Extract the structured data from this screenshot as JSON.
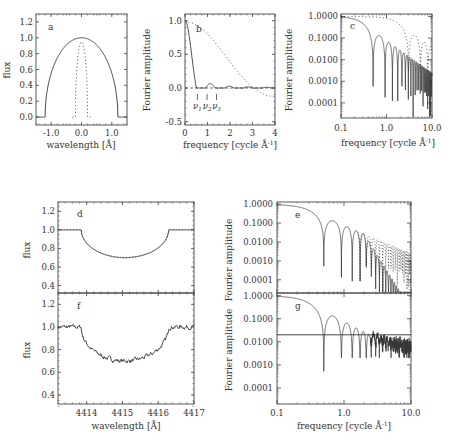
{
  "chart_data": [
    {
      "panel": "a",
      "type": "line",
      "xlabel": "wavelength [Å]",
      "ylabel": "flux",
      "xlim": [
        -1.5,
        1.5
      ],
      "ylim": [
        -0.1,
        1.3
      ],
      "xticks": [
        "-1.0",
        "0.0",
        "1.0"
      ],
      "yticks": [
        "0.0",
        "0.2",
        "0.4",
        "0.6",
        "0.8",
        "1.0",
        "1.2"
      ],
      "series": [
        {
          "name": "broad profile (solid)",
          "style": "solid",
          "description": "semi-ellipse from -1.2 to 1.2 Å, peak 1.0 at 0.0"
        },
        {
          "name": "narrow profile (dotted)",
          "style": "dotted",
          "description": "narrow peak ~0.95 at 0.0, width ~0.4 Å"
        }
      ]
    },
    {
      "panel": "b",
      "type": "line",
      "xlabel": "frequency [cycle Å⁻¹]",
      "ylabel": "Fourier amplitude",
      "xlim": [
        0,
        4
      ],
      "ylim": [
        -0.55,
        1.1
      ],
      "xticks": [
        "0",
        "1",
        "2",
        "3",
        "4"
      ],
      "yticks": [
        "-0.5",
        "0.0",
        "0.5",
        "1.0"
      ],
      "annotations": [
        "ν1",
        "ν2",
        "ν3"
      ],
      "annotation_x": [
        0.55,
        0.98,
        1.4
      ],
      "series": [
        {
          "name": "transform of broad profile (solid)",
          "style": "solid",
          "x": [
            0,
            0.2,
            0.4,
            0.55,
            0.75,
            0.98,
            1.15,
            1.4,
            1.6,
            2.0,
            4.0
          ],
          "y": [
            1.0,
            0.7,
            0.25,
            0.0,
            0.12,
            0.0,
            0.06,
            0.0,
            0.03,
            0.0,
            0.0
          ]
        },
        {
          "name": "transform of narrow profile (dotted)",
          "style": "dotted",
          "x": [
            0,
            1,
            2,
            3,
            4
          ],
          "y": [
            1.0,
            0.93,
            0.72,
            0.47,
            0.22
          ]
        }
      ]
    },
    {
      "panel": "c",
      "type": "line",
      "xscale": "log",
      "yscale": "log",
      "xlabel": "frequency [cycle Å⁻¹]",
      "ylabel": "Fourier amplitude",
      "xlim": [
        0.1,
        10.0
      ],
      "ylim": [
        2e-05,
        1.3
      ],
      "xticks": [
        "0.1",
        "1.0",
        "10.0"
      ],
      "yticks": [
        "0.0001",
        "0.0010",
        "0.0100",
        "0.1000",
        "1.0000"
      ],
      "series": [
        {
          "name": "solid",
          "style": "solid",
          "description": "sinc-like lobes, first zero ~0.55, lobe peaks ~0.1 at 0.75, decaying to ~0.003 at 10"
        },
        {
          "name": "dotted",
          "style": "dotted",
          "description": "smooth decline from 1.0 to ~0.003 near 10"
        }
      ]
    },
    {
      "panel": "d",
      "type": "line",
      "xlabel": "",
      "ylabel": "flux",
      "xlim": [
        4413.2,
        4417.0
      ],
      "ylim": [
        0.3,
        1.3
      ],
      "yticks": [
        "0.4",
        "0.6",
        "0.8",
        "1.0",
        "1.2"
      ],
      "series": [
        {
          "name": "model profile",
          "style": "solid",
          "description": "continuum 1.0, dip from 4413.85 to 4416.3, min 0.70 at 4415.05"
        }
      ]
    },
    {
      "panel": "f",
      "type": "line",
      "xlabel": "wavelength [Å]",
      "ylabel": "flux",
      "xlim": [
        4413.2,
        4417.0
      ],
      "ylim": [
        0.3,
        1.3
      ],
      "xticks": [
        "4414",
        "4415",
        "4416",
        "4417"
      ],
      "yticks": [
        "0.4",
        "0.6",
        "0.8",
        "1.0",
        "1.2"
      ],
      "series": [
        {
          "name": "observed noisy profile",
          "style": "solid",
          "description": "noisy continuum ~1.0, dip min ~0.69 at 4415.1"
        }
      ]
    },
    {
      "panel": "e",
      "type": "line",
      "xscale": "log",
      "yscale": "log",
      "ylabel": "Fourier amplitude",
      "xlim": [
        0.1,
        10.0
      ],
      "ylim": [
        2e-05,
        1.3
      ],
      "yticks": [
        "0.0001",
        "0.0010",
        "0.0100",
        "0.1000",
        "1.0000"
      ],
      "series": [
        {
          "name": "solid",
          "style": "solid",
          "description": "sinc lobes, zeros at 0.55, 0.93, 1.3, ..."
        },
        {
          "name": "dotted",
          "style": "dotted",
          "description": "additional lobes diverging above 2 cycle/Å"
        }
      ]
    },
    {
      "panel": "g",
      "type": "line",
      "xscale": "log",
      "yscale": "log",
      "xlabel": "frequency [cycle Å⁻¹]",
      "ylabel": "Fourier amplitude",
      "xlim": [
        0.1,
        10.0
      ],
      "ylim": [
        2e-05,
        1.3
      ],
      "xticks": [
        "0.1",
        "1.0",
        "10.0"
      ],
      "yticks": [
        "0.0001",
        "0.0010",
        "0.0100",
        "0.1000",
        "1.0000"
      ],
      "noise_level": 0.02,
      "series": [
        {
          "name": "noisy transform",
          "style": "solid",
          "description": "lobes then noise floor ~0.01 above 3 cycle/Å"
        },
        {
          "name": "noise level line",
          "style": "solid",
          "y": 0.02
        }
      ]
    }
  ],
  "labels": {
    "a": "a",
    "b": "b",
    "c": "c",
    "d": "d",
    "e": "e",
    "f": "f",
    "g": "g",
    "flux": "flux",
    "fourier_amp": "Fourier amplitude",
    "wavelength": "wavelength [Å]",
    "frequency": "frequency [cycle Å",
    "frequency_sup": "-1",
    "frequency_close": "]",
    "nu1": "ν",
    "nu1_sub": "1",
    "nu2": "ν",
    "nu2_sub": "2",
    "nu3": "ν",
    "nu3_sub": "3"
  },
  "ticks": {
    "a_x": [
      "-1.0",
      "0.0",
      "1.0"
    ],
    "a_y": [
      "0.0",
      "0.2",
      "0.4",
      "0.6",
      "0.8",
      "1.0",
      "1.2"
    ],
    "b_x": [
      "0",
      "1",
      "2",
      "3",
      "4"
    ],
    "b_y": [
      "-0.5",
      "0.0",
      "0.5",
      "1.0"
    ],
    "log_x": [
      "0.1",
      "1.0",
      "10.0"
    ],
    "log_y": [
      "0.0001",
      "0.0010",
      "0.0100",
      "0.1000",
      "1.0000"
    ],
    "df_y": [
      "0.4",
      "0.6",
      "0.8",
      "1.0",
      "1.2"
    ],
    "f_x": [
      "4414",
      "4415",
      "4416",
      "4417"
    ]
  }
}
